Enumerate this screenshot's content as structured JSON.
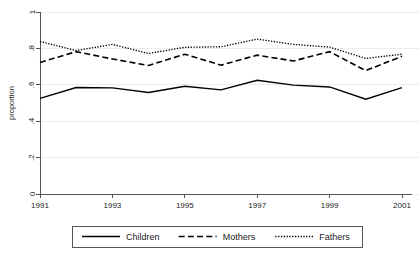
{
  "chart_data": {
    "type": "line",
    "title": "",
    "xlabel": "",
    "ylabel": "proportion",
    "x": [
      1991,
      1992,
      1993,
      1994,
      1995,
      1996,
      1997,
      1998,
      1999,
      2000,
      2001
    ],
    "xlim": [
      1991,
      2001
    ],
    "ylim": [
      0,
      1
    ],
    "xticks": [
      1991,
      1993,
      1995,
      1997,
      1999,
      2001
    ],
    "xticklabels": [
      "1991",
      "1993",
      "1995",
      "1997",
      "1999",
      "2001"
    ],
    "yticks": [
      0,
      0.2,
      0.4,
      0.6,
      0.8,
      1
    ],
    "yticklabels": [
      "0",
      ".2",
      ".4",
      ".6",
      ".8",
      "1"
    ],
    "grid": true,
    "grid_axis": "y",
    "legend_position": "bottom",
    "series": [
      {
        "name": "Children",
        "style": "solid",
        "values": [
          0.525,
          0.585,
          0.583,
          0.558,
          0.592,
          0.572,
          0.625,
          0.598,
          0.588,
          0.521,
          0.585
        ]
      },
      {
        "name": "Mothers",
        "style": "dashed",
        "values": [
          0.723,
          0.782,
          0.742,
          0.706,
          0.768,
          0.708,
          0.763,
          0.731,
          0.782,
          0.678,
          0.757
        ]
      },
      {
        "name": "Fathers",
        "style": "dotted",
        "values": [
          0.838,
          0.788,
          0.822,
          0.772,
          0.806,
          0.809,
          0.851,
          0.822,
          0.807,
          0.745,
          0.768
        ]
      }
    ]
  },
  "axes": {
    "y_axis_title": "proportion"
  },
  "legend": {
    "items": [
      {
        "label": "Children",
        "style": "solid"
      },
      {
        "label": "Mothers",
        "style": "dashed"
      },
      {
        "label": "Fathers",
        "style": "dotted"
      }
    ]
  },
  "colors": {
    "line": "#000000",
    "grid": "#ececec",
    "axis": "#555555",
    "background": "#ffffff"
  }
}
